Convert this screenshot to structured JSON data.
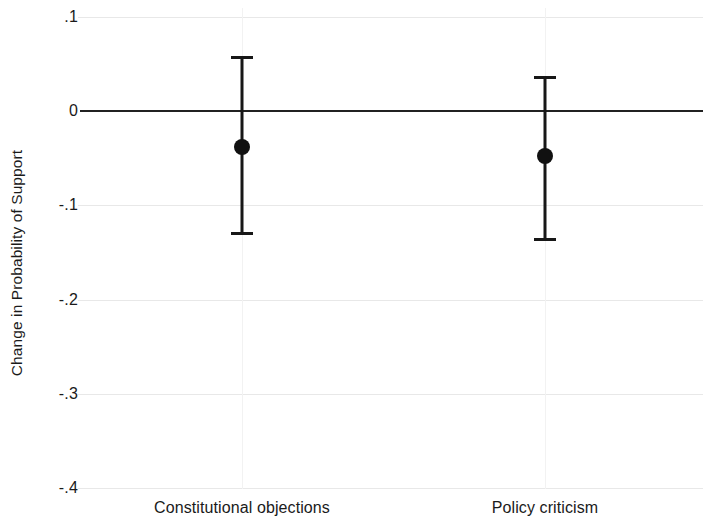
{
  "chart_data": {
    "type": "scatter",
    "title": "",
    "subtitle": "",
    "xlabel": "",
    "ylabel": "Change in Probability of Support",
    "categories": [
      "Constitutional objections",
      "Policy criticism"
    ],
    "ylim": [
      -0.4,
      0.1
    ],
    "xlim": [
      0,
      1
    ],
    "grid": true,
    "legend": false,
    "y_ticks": [
      {
        "value": 0.1,
        "label": ".1"
      },
      {
        "value": 0.0,
        "label": "0"
      },
      {
        "value": -0.1,
        "label": "-.1"
      },
      {
        "value": -0.2,
        "label": "-.2"
      },
      {
        "value": -0.3,
        "label": "-.3"
      },
      {
        "value": -0.4,
        "label": "-.4"
      }
    ],
    "reference_line": 0,
    "series": [
      {
        "name": "Change in Probability of Support",
        "points": [
          {
            "category": "Constitutional objections",
            "estimate": -0.038,
            "ci_low": -0.13,
            "ci_high": 0.059
          },
          {
            "category": "Policy criticism",
            "estimate": -0.048,
            "ci_low": -0.137,
            "ci_high": 0.037
          }
        ]
      }
    ]
  },
  "axis": {
    "y_title": "Change in Probability of Support"
  }
}
